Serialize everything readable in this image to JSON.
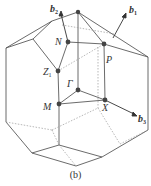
{
  "figure": {
    "caption": "(b)",
    "vectors": [
      {
        "id": "b2",
        "name": "b",
        "subscript": "2"
      },
      {
        "id": "b1",
        "name": "b",
        "subscript": "1"
      },
      {
        "id": "b3",
        "name": "b",
        "subscript": "3"
      }
    ],
    "points": [
      {
        "id": "N",
        "label": "N"
      },
      {
        "id": "P",
        "label": "P"
      },
      {
        "id": "Z1",
        "label": "Z",
        "subscript": "1"
      },
      {
        "id": "Gamma",
        "label": "Γ"
      },
      {
        "id": "M",
        "label": "M"
      },
      {
        "id": "X",
        "label": "X"
      }
    ],
    "colors": {
      "edge": "#5a5a5a",
      "hidden_edge": "#9a9a9a",
      "point": "#444444"
    }
  }
}
